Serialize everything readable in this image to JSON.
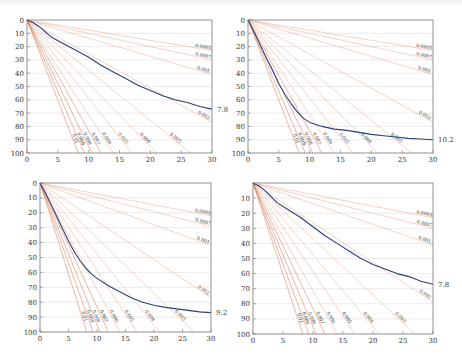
{
  "chart_data": [
    {
      "type": "line",
      "panel": "top-left",
      "xlim": [
        0,
        30
      ],
      "ylim": [
        0,
        100
      ],
      "y_inverted": true,
      "xticks": [
        0,
        5,
        10,
        15,
        20,
        25,
        30
      ],
      "yticks": [
        0,
        10,
        20,
        30,
        40,
        50,
        60,
        70,
        80,
        90,
        100
      ],
      "grid": "horizontal",
      "rays": [
        {
          "label": "0.0005",
          "end": [
            30,
            23
          ]
        },
        {
          "label": "0.0007",
          "end": [
            30,
            30
          ]
        },
        {
          "label": "0.001",
          "end": [
            30,
            41
          ]
        },
        {
          "label": "0.002",
          "end": [
            30,
            77
          ]
        },
        {
          "label": "0.003",
          "end": [
            26.5,
            100
          ]
        },
        {
          "label": "0.004",
          "end": [
            21,
            100
          ]
        },
        {
          "label": "0.005",
          "end": [
            17,
            100
          ]
        },
        {
          "label": "0.006",
          "end": [
            14,
            100
          ]
        },
        {
          "label": "0.007",
          "end": [
            12,
            100
          ]
        },
        {
          "label": "0.008",
          "end": [
            10.5,
            100
          ]
        },
        {
          "label": "0.009",
          "end": [
            9.3,
            100
          ]
        },
        {
          "label": "0.01",
          "end": [
            8.3,
            100
          ]
        }
      ],
      "curve": {
        "end_label": "7.8",
        "x": [
          0,
          1,
          2,
          3,
          4,
          6,
          8,
          10,
          12,
          14,
          16,
          18,
          20,
          22,
          24,
          26,
          28,
          30
        ],
        "y": [
          0,
          2,
          5,
          9,
          13,
          18,
          23,
          28,
          34,
          39,
          44,
          49,
          53,
          57,
          60,
          62,
          65,
          67
        ]
      }
    },
    {
      "type": "line",
      "panel": "top-right",
      "xlim": [
        0,
        30
      ],
      "ylim": [
        0,
        100
      ],
      "y_inverted": true,
      "xticks": [
        0,
        5,
        10,
        15,
        20,
        25,
        30
      ],
      "yticks": [
        0,
        10,
        20,
        30,
        40,
        50,
        60,
        70,
        80,
        90,
        100
      ],
      "grid": "horizontal",
      "rays": [
        {
          "label": "0.0005",
          "end": [
            30,
            23
          ]
        },
        {
          "label": "0.0007",
          "end": [
            30,
            30
          ]
        },
        {
          "label": "0.001",
          "end": [
            30,
            41
          ]
        },
        {
          "label": "0.002",
          "end": [
            30,
            77
          ]
        },
        {
          "label": "0.003",
          "end": [
            26.5,
            100
          ]
        },
        {
          "label": "0.004",
          "end": [
            21,
            100
          ]
        },
        {
          "label": "0.005",
          "end": [
            17,
            100
          ]
        },
        {
          "label": "0.006",
          "end": [
            14,
            100
          ]
        },
        {
          "label": "0.007",
          "end": [
            12,
            100
          ]
        },
        {
          "label": "0.008",
          "end": [
            10.5,
            100
          ]
        },
        {
          "label": "0.009",
          "end": [
            9.3,
            100
          ]
        },
        {
          "label": "0.01",
          "end": [
            8.3,
            100
          ]
        }
      ],
      "curve": {
        "end_label": "10.2",
        "x": [
          0,
          1,
          2,
          3,
          4,
          5,
          6,
          7,
          8,
          9,
          10,
          12,
          14,
          16,
          18,
          20,
          22,
          24,
          26,
          28,
          30
        ],
        "y": [
          0,
          9,
          19,
          29,
          38,
          48,
          56,
          63,
          69,
          74,
          77,
          80,
          82,
          83,
          84.5,
          86,
          87,
          88,
          89,
          89.5,
          90
        ]
      }
    },
    {
      "type": "line",
      "panel": "bottom-left",
      "xlim": [
        0,
        30
      ],
      "ylim": [
        0,
        100
      ],
      "y_inverted": true,
      "xticks": [
        0,
        5,
        10,
        15,
        20,
        25,
        30
      ],
      "yticks": [
        0,
        10,
        20,
        30,
        40,
        50,
        60,
        70,
        80,
        90,
        100
      ],
      "grid": "horizontal",
      "rays": [
        {
          "label": "0.0005",
          "end": [
            30,
            22
          ]
        },
        {
          "label": "0.0007",
          "end": [
            30,
            29
          ]
        },
        {
          "label": "0.001",
          "end": [
            30,
            42
          ]
        },
        {
          "label": "0.002",
          "end": [
            30,
            77
          ]
        },
        {
          "label": "0.003",
          "end": [
            27,
            100
          ]
        },
        {
          "label": "0.004",
          "end": [
            21,
            100
          ]
        },
        {
          "label": "0.005",
          "end": [
            17,
            100
          ]
        },
        {
          "label": "0.006",
          "end": [
            14,
            100
          ]
        },
        {
          "label": "0.007",
          "end": [
            12,
            100
          ]
        },
        {
          "label": "0.008",
          "end": [
            10.5,
            100
          ]
        },
        {
          "label": "0.009",
          "end": [
            9.3,
            100
          ]
        },
        {
          "label": "0.01",
          "end": [
            8.2,
            100
          ]
        }
      ],
      "curve": {
        "end_label": "9.2",
        "x": [
          0,
          1,
          2,
          3,
          4,
          5,
          6,
          7,
          8,
          9,
          10,
          12,
          14,
          16,
          18,
          20,
          22,
          24,
          26,
          28,
          30
        ],
        "y": [
          0,
          7,
          15,
          23,
          31,
          39,
          46,
          52,
          57,
          61,
          64,
          69,
          73,
          77,
          80,
          82,
          83.5,
          84.5,
          85.5,
          86.5,
          87
        ]
      }
    },
    {
      "type": "line",
      "panel": "bottom-right",
      "xlim": [
        0,
        30
      ],
      "ylim": [
        0,
        100
      ],
      "y_inverted": true,
      "xticks": [
        0,
        5,
        10,
        15,
        20,
        25,
        30
      ],
      "yticks": [
        10,
        20,
        30,
        40,
        50,
        60,
        70,
        80,
        90,
        100
      ],
      "grid": "horizontal",
      "rays": [
        {
          "label": "0.0005",
          "end": [
            30,
            23
          ]
        },
        {
          "label": "0.0007",
          "end": [
            30,
            30
          ]
        },
        {
          "label": "0.001",
          "end": [
            30,
            41
          ]
        },
        {
          "label": "0.002",
          "end": [
            30,
            79
          ]
        },
        {
          "label": "0.003",
          "end": [
            27,
            100
          ]
        },
        {
          "label": "0.004",
          "end": [
            21,
            100
          ]
        },
        {
          "label": "0.005",
          "end": [
            17,
            100
          ]
        },
        {
          "label": "0.006",
          "end": [
            14,
            100
          ]
        },
        {
          "label": "0.007",
          "end": [
            12,
            100
          ]
        },
        {
          "label": "0.008",
          "end": [
            10.5,
            100
          ]
        },
        {
          "label": "0.009",
          "end": [
            9.3,
            100
          ]
        },
        {
          "label": "0.01",
          "end": [
            8.3,
            100
          ]
        }
      ],
      "curve": {
        "end_label": "7.8",
        "x": [
          0,
          1,
          2,
          3,
          4,
          6,
          8,
          10,
          12,
          14,
          16,
          18,
          20,
          22,
          24,
          26,
          28,
          30
        ],
        "y": [
          0,
          2,
          5,
          9,
          13,
          18,
          23,
          29,
          35,
          40,
          45,
          50,
          54,
          57,
          60,
          62,
          65,
          67
        ]
      }
    }
  ],
  "panels": [
    {
      "x": 27,
      "y": 20,
      "w": 185,
      "h": 133
    },
    {
      "x": 248,
      "y": 20,
      "w": 185,
      "h": 133
    },
    {
      "x": 40,
      "y": 183,
      "w": 171,
      "h": 149
    },
    {
      "x": 253,
      "y": 183,
      "w": 180,
      "h": 151
    }
  ],
  "colors": {
    "curve": "#2a3f7a",
    "ray": "#e8a486",
    "ray_dark": "#d06a45",
    "grid": "#dddddd",
    "frame": "#777777",
    "text": "#333333"
  }
}
